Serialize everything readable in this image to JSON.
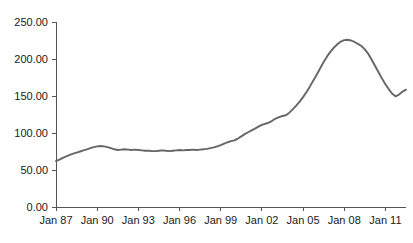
{
  "chart_data": {
    "type": "line",
    "title": "",
    "subtitle": "",
    "xlabel": "",
    "ylabel": "",
    "legend": [],
    "legend_position": "none",
    "grid": false,
    "line_color": "#666666",
    "axis_color": "#555555",
    "text_color": "#1a1a1a",
    "background": "#ffffff",
    "xlim": [
      1987.0,
      2012.5
    ],
    "ylim": [
      0.0,
      250.0
    ],
    "y_ticks": [
      0,
      50,
      100,
      150,
      200,
      250
    ],
    "y_tick_labels": [
      "0.00",
      "50.00",
      "100.00",
      "150.00",
      "200.00",
      "250.00"
    ],
    "x_ticks": [
      1987,
      1990,
      1993,
      1996,
      1999,
      2002,
      2005,
      2008,
      2011
    ],
    "x_tick_labels": [
      "Jan 87",
      "Jan 90",
      "Jan 93",
      "Jan 96",
      "Jan 99",
      "Jan 02",
      "Jan 05",
      "Jan 08",
      "Jan 11"
    ],
    "x": [
      1987.0,
      1987.25,
      1987.5,
      1987.75,
      1988.0,
      1988.25,
      1988.5,
      1988.75,
      1989.0,
      1989.25,
      1989.5,
      1989.75,
      1990.0,
      1990.25,
      1990.5,
      1990.75,
      1991.0,
      1991.25,
      1991.5,
      1991.75,
      1992.0,
      1992.25,
      1992.5,
      1992.75,
      1993.0,
      1993.25,
      1993.5,
      1993.75,
      1994.0,
      1994.25,
      1994.5,
      1994.75,
      1995.0,
      1995.25,
      1995.5,
      1995.75,
      1996.0,
      1996.25,
      1996.5,
      1996.75,
      1997.0,
      1997.25,
      1997.5,
      1997.75,
      1998.0,
      1998.25,
      1998.5,
      1998.75,
      1999.0,
      1999.25,
      1999.5,
      1999.75,
      2000.0,
      2000.25,
      2000.5,
      2000.75,
      2001.0,
      2001.25,
      2001.5,
      2001.75,
      2002.0,
      2002.25,
      2002.5,
      2002.75,
      2003.0,
      2003.25,
      2003.5,
      2003.75,
      2004.0,
      2004.25,
      2004.5,
      2004.75,
      2005.0,
      2005.25,
      2005.5,
      2005.75,
      2006.0,
      2006.25,
      2006.5,
      2006.75,
      2007.0,
      2007.25,
      2007.5,
      2007.75,
      2008.0,
      2008.25,
      2008.5,
      2008.75,
      2009.0,
      2009.25,
      2009.5,
      2009.75,
      2010.0,
      2010.25,
      2010.5,
      2010.75,
      2011.0,
      2011.25,
      2011.5,
      2011.75,
      2012.0,
      2012.25,
      2012.5
    ],
    "values": [
      62.0,
      64.0,
      66.5,
      68.5,
      70.5,
      72.0,
      73.5,
      75.0,
      76.5,
      78.0,
      79.5,
      81.0,
      82.0,
      82.5,
      82.0,
      81.0,
      79.5,
      78.0,
      77.0,
      77.5,
      78.0,
      77.5,
      77.0,
      77.5,
      77.0,
      76.5,
      76.0,
      76.0,
      75.5,
      75.5,
      76.0,
      76.5,
      76.0,
      75.5,
      76.0,
      76.5,
      77.0,
      76.5,
      77.0,
      77.0,
      77.5,
      77.0,
      77.5,
      78.0,
      78.5,
      79.5,
      80.5,
      82.0,
      83.5,
      85.5,
      87.5,
      89.0,
      90.0,
      92.5,
      95.5,
      98.5,
      101.0,
      103.5,
      106.0,
      108.5,
      111.0,
      112.5,
      114.0,
      116.5,
      119.5,
      121.5,
      123.0,
      124.0,
      127.5,
      132.0,
      137.0,
      142.5,
      148.5,
      155.5,
      163.0,
      171.0,
      179.0,
      187.5,
      196.0,
      203.5,
      210.0,
      215.5,
      220.0,
      223.5,
      225.5,
      226.0,
      225.0,
      223.0,
      220.5,
      217.5,
      213.0,
      207.0,
      199.0,
      190.5,
      182.0,
      173.5,
      166.0,
      159.0,
      153.0,
      149.5,
      152.0,
      156.0,
      158.5
    ]
  },
  "axis": {
    "y_label_suffix": "",
    "x_label_prefix": "Jan"
  }
}
